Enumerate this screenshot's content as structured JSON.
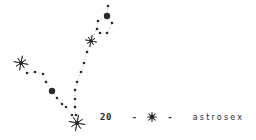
{
  "colors": {
    "ink": "#2a2a2a",
    "background": "#ffffff"
  },
  "caption": {
    "number": "20",
    "dash_left": "-",
    "symbol": "star-icon",
    "dash_right": "-",
    "brand": "astrosex"
  },
  "constellation": {
    "stars": [
      {
        "name": "star-left",
        "x": 21,
        "y": 63,
        "r": 7
      },
      {
        "name": "star-upper",
        "x": 91,
        "y": 41,
        "r": 5.5
      },
      {
        "name": "star-bottom",
        "x": 77,
        "y": 123,
        "r": 8
      }
    ],
    "big_dots": [
      {
        "name": "dot-top",
        "x": 107,
        "y": 16,
        "r": 3.2
      },
      {
        "name": "dot-left",
        "x": 52,
        "y": 91,
        "r": 3.2
      }
    ],
    "small_dots": [
      {
        "x": 108,
        "y": 6
      },
      {
        "x": 98,
        "y": 21
      },
      {
        "x": 112,
        "y": 23
      },
      {
        "x": 97,
        "y": 29
      },
      {
        "x": 100,
        "y": 33
      },
      {
        "x": 107,
        "y": 33
      },
      {
        "x": 87,
        "y": 52
      },
      {
        "x": 84,
        "y": 63
      },
      {
        "x": 81,
        "y": 72
      },
      {
        "x": 77,
        "y": 82
      },
      {
        "x": 75,
        "y": 90
      },
      {
        "x": 75,
        "y": 99
      },
      {
        "x": 75,
        "y": 107
      },
      {
        "x": 76,
        "y": 115
      },
      {
        "x": 27,
        "y": 73
      },
      {
        "x": 35,
        "y": 72
      },
      {
        "x": 43,
        "y": 74
      },
      {
        "x": 46,
        "y": 82
      },
      {
        "x": 57,
        "y": 98
      },
      {
        "x": 62,
        "y": 104
      },
      {
        "x": 66,
        "y": 107
      },
      {
        "x": 72,
        "y": 115
      }
    ],
    "lines": [
      [
        [
          21,
          63
        ],
        [
          27,
          73
        ],
        [
          35,
          72
        ],
        [
          43,
          74
        ],
        [
          46,
          82
        ],
        [
          52,
          91
        ],
        [
          57,
          98
        ],
        [
          62,
          104
        ],
        [
          66,
          107
        ],
        [
          72,
          115
        ],
        [
          77,
          123
        ]
      ],
      [
        [
          77,
          123
        ],
        [
          76,
          115
        ],
        [
          75,
          107
        ],
        [
          75,
          99
        ],
        [
          75,
          90
        ],
        [
          77,
          82
        ],
        [
          81,
          72
        ],
        [
          84,
          63
        ],
        [
          87,
          52
        ],
        [
          91,
          41
        ]
      ],
      [
        [
          91,
          41
        ],
        [
          97,
          29
        ],
        [
          100,
          33
        ],
        [
          107,
          33
        ],
        [
          112,
          23
        ],
        [
          107,
          16
        ],
        [
          98,
          21
        ],
        [
          97,
          29
        ]
      ],
      [
        [
          107,
          16
        ],
        [
          108,
          6
        ]
      ]
    ]
  }
}
